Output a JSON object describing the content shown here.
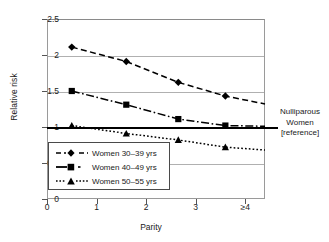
{
  "chart_data": {
    "type": "line",
    "title": "",
    "xlabel": "Parity",
    "ylabel": "Relative risk",
    "xlim": [
      0,
      4.4
    ],
    "ylim": [
      0,
      2.5
    ],
    "yticks": [
      "0",
      "0.5",
      "1",
      "1.5",
      "2",
      "2.5"
    ],
    "ytick_values": [
      0,
      0.5,
      1,
      1.5,
      2,
      2.5
    ],
    "xticks": [
      "0",
      "1",
      "2",
      "3",
      "≥4"
    ],
    "xtick_values": [
      0,
      1,
      2,
      3,
      4
    ],
    "grid": "horizontal",
    "legend_position": "lower-left",
    "x": [
      0.5,
      1.6,
      2.65,
      3.6
    ],
    "series": [
      {
        "name": "Women 30–39 yrs",
        "values": [
          2.11,
          1.91,
          1.62,
          1.43
        ],
        "end_value": 1.32,
        "marker": "diamond",
        "dash": "dashed",
        "color": "#000000"
      },
      {
        "name": "Women 40–49 yrs",
        "values": [
          1.5,
          1.31,
          1.11,
          1.02
        ],
        "end_value": 1.01,
        "marker": "square",
        "dash": "dash-dot",
        "color": "#000000"
      },
      {
        "name": "Women 50–55 yrs",
        "values": [
          1.02,
          0.91,
          0.82,
          0.72
        ],
        "end_value": 0.68,
        "marker": "triangle",
        "dash": "dotted",
        "color": "#000000"
      }
    ],
    "reference_line": {
      "y": 1,
      "label_lines": [
        "Nulliparous",
        "Women",
        "[reference]"
      ]
    },
    "annotations": [
      {
        "text": "Nulliparous",
        "position": "right-of-axis"
      },
      {
        "text": "Women",
        "position": "right-of-axis"
      },
      {
        "text": "[reference]",
        "position": "right-of-axis"
      }
    ]
  },
  "legend": {
    "items": [
      {
        "label": "Women 30–39 yrs",
        "marker": "diamond",
        "dash": "dashed"
      },
      {
        "label": "Women 40–49 yrs",
        "marker": "square",
        "dash": "dash-dot"
      },
      {
        "label": "Women 50–55 yrs",
        "marker": "triangle",
        "dash": "dotted"
      }
    ]
  }
}
